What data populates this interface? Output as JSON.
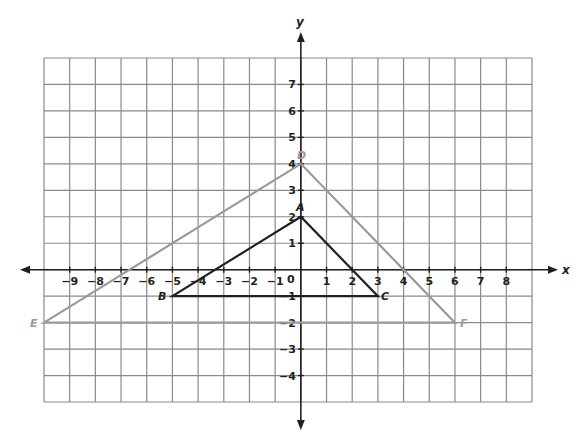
{
  "chart_data": {
    "type": "coordinate-plane",
    "title": "",
    "xlabel": "x",
    "ylabel": "y",
    "grid": true,
    "xlim": [
      -10,
      9
    ],
    "ylim": [
      -5,
      8
    ],
    "x_ticks": [
      -9,
      -8,
      -7,
      -6,
      -5,
      -4,
      -3,
      -2,
      -1,
      1,
      2,
      3,
      4,
      5,
      6,
      7,
      8
    ],
    "y_ticks": [
      7,
      6,
      5,
      4,
      3,
      2,
      1,
      -1,
      -2,
      -3,
      -4
    ],
    "origin_label": "0",
    "shapes": [
      {
        "name": "triangle DEF",
        "color": "#9a9a9a",
        "vertices": [
          {
            "label": "D",
            "x": 0,
            "y": 4
          },
          {
            "label": "E",
            "x": -10,
            "y": -2
          },
          {
            "label": "F",
            "x": 6,
            "y": -2
          }
        ]
      },
      {
        "name": "triangle ABC",
        "color": "#231f20",
        "vertices": [
          {
            "label": "A",
            "x": 0,
            "y": 2
          },
          {
            "label": "B",
            "x": -5,
            "y": -1
          },
          {
            "label": "C",
            "x": 3,
            "y": -1
          }
        ]
      }
    ]
  },
  "labels": {
    "x_axis": "x",
    "y_axis": "y",
    "origin": "0",
    "A": "A",
    "B": "B",
    "C": "C",
    "D": "D",
    "E": "E",
    "F": "F"
  },
  "colors": {
    "grid": "#8a8a8a",
    "axis": "#231f20",
    "triangle_abc": "#231f20",
    "triangle_def": "#9a9a9a"
  }
}
